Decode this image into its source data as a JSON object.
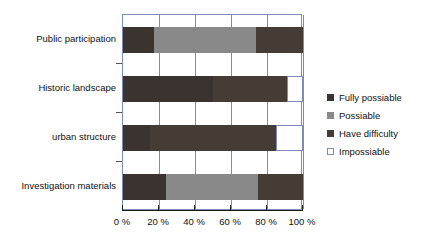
{
  "chart_data": {
    "type": "bar",
    "orientation": "horizontal",
    "stacked": true,
    "normalized_percent": true,
    "title": "",
    "subtitle": "",
    "xlabel": "",
    "ylabel": "",
    "xlim": [
      0,
      100
    ],
    "grid": true,
    "legend_position": "right",
    "categories": [
      "Public participation",
      "Historic landscape",
      "urban structure",
      "Investigation materials"
    ],
    "x_tick_labels": [
      "0 %",
      "20 %",
      "40 %",
      "60 %",
      "80 %",
      "100 %"
    ],
    "x_tick_values": [
      0,
      20,
      40,
      60,
      80,
      100
    ],
    "series": [
      {
        "name": "Fully possiable",
        "color": "#3b332f",
        "values": [
          17,
          50,
          15,
          24
        ]
      },
      {
        "name": "Possiable",
        "color": "#898989",
        "values": [
          57,
          0,
          0,
          51
        ]
      },
      {
        "name": "Have difficulty",
        "color": "#463c36",
        "values": [
          26,
          41,
          70,
          25
        ]
      },
      {
        "name": "Impossiable",
        "color": "#ffffff",
        "values": [
          0,
          9,
          15,
          0
        ]
      }
    ]
  },
  "legend": {
    "items": [
      {
        "label": "Fully possiable",
        "swatch": "legend-swatch-fully-possiable"
      },
      {
        "label": "Possiable",
        "swatch": "legend-swatch-possiable"
      },
      {
        "label": "Have difficulty",
        "swatch": "legend-swatch-have-difficulty"
      },
      {
        "label": "Impossiable",
        "swatch": "legend-swatch-impossiable"
      }
    ]
  },
  "colors": {
    "frame": "#7b8db5",
    "axis": "#1a1a1a",
    "text": "#111111",
    "background": "#ffffff"
  }
}
